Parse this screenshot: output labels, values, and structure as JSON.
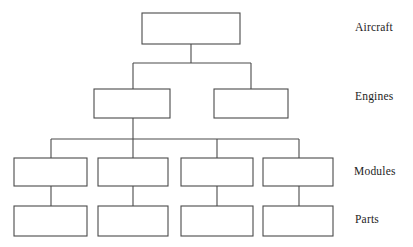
{
  "diagram": {
    "type": "hierarchy-tree",
    "orientation": "top-down",
    "colors": {
      "box_fill": "#ffffff",
      "box_stroke": "#4a4a4a",
      "connector": "#4a4a4a",
      "label_text": "#1d1d1d",
      "background": "#ffffff"
    },
    "levels": [
      {
        "id": "aircraft",
        "label": "Aircraft",
        "label_x": 355,
        "label_y": 21,
        "node_count": 1,
        "nodes": [
          {
            "id": "aircraft-1",
            "text": "",
            "x": 142,
            "y": 13,
            "w": 98,
            "h": 31
          }
        ]
      },
      {
        "id": "engines",
        "label": "Engines",
        "label_x": 355,
        "label_y": 90,
        "node_count": 2,
        "nodes": [
          {
            "id": "engine-1",
            "text": "",
            "x": 94,
            "y": 89,
            "w": 76,
            "h": 29
          },
          {
            "id": "engine-2",
            "text": "",
            "x": 214,
            "y": 89,
            "w": 74,
            "h": 29
          }
        ]
      },
      {
        "id": "modules",
        "label": "Modules",
        "label_x": 354,
        "label_y": 165,
        "node_count": 4,
        "nodes": [
          {
            "id": "module-1",
            "text": "",
            "x": 14,
            "y": 158,
            "w": 73,
            "h": 28
          },
          {
            "id": "module-2",
            "text": "",
            "x": 98,
            "y": 158,
            "w": 70,
            "h": 28
          },
          {
            "id": "module-3",
            "text": "",
            "x": 181,
            "y": 158,
            "w": 72,
            "h": 28
          },
          {
            "id": "module-4",
            "text": "",
            "x": 263,
            "y": 158,
            "w": 70,
            "h": 28
          }
        ]
      },
      {
        "id": "parts",
        "label": "Parts",
        "label_x": 355,
        "label_y": 213,
        "node_count": 4,
        "nodes": [
          {
            "id": "part-1",
            "text": "",
            "x": 14,
            "y": 206,
            "w": 73,
            "h": 30
          },
          {
            "id": "part-2",
            "text": "",
            "x": 98,
            "y": 206,
            "w": 70,
            "h": 30
          },
          {
            "id": "part-3",
            "text": "",
            "x": 181,
            "y": 206,
            "w": 72,
            "h": 30
          },
          {
            "id": "part-4",
            "text": "",
            "x": 263,
            "y": 206,
            "w": 70,
            "h": 30
          }
        ]
      }
    ],
    "connectors": {
      "aircraft_to_engines": {
        "stem_x": 191,
        "stem_from_y": 44,
        "bus_y": 63,
        "bus_x1": 133,
        "bus_x2": 251,
        "drops": [
          {
            "x": 133,
            "to_y": 89
          },
          {
            "x": 251,
            "to_y": 89
          }
        ]
      },
      "engine_to_modules": {
        "stem_x": 133,
        "stem_from_y": 118,
        "bus_y": 139,
        "bus_x1": 51,
        "bus_x2": 299,
        "drops": [
          {
            "x": 51,
            "to_y": 158
          },
          {
            "x": 133,
            "to_y": 158
          },
          {
            "x": 217,
            "to_y": 158
          },
          {
            "x": 299,
            "to_y": 158
          }
        ]
      },
      "modules_to_parts": [
        {
          "x": 51,
          "from_y": 186,
          "to_y": 206
        },
        {
          "x": 133,
          "from_y": 186,
          "to_y": 206
        },
        {
          "x": 217,
          "from_y": 186,
          "to_y": 206
        },
        {
          "x": 299,
          "from_y": 186,
          "to_y": 206
        }
      ]
    }
  }
}
